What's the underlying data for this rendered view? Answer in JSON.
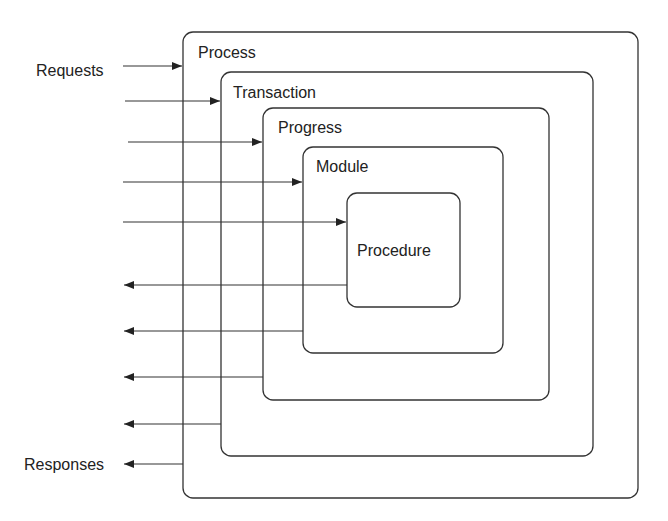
{
  "diagram": {
    "boxes": [
      {
        "label": "Process"
      },
      {
        "label": "Transaction"
      },
      {
        "label": "Progress"
      },
      {
        "label": "Module"
      },
      {
        "label": "Procedure"
      }
    ],
    "inputs_label": "Requests",
    "outputs_label": "Responses",
    "stroke_color": "#333333"
  }
}
